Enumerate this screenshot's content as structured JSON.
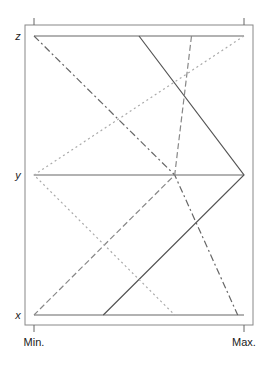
{
  "chart_data": {
    "type": "parallel_coordinates",
    "title": "",
    "variables": [
      "z",
      "y",
      "x"
    ],
    "range_labels": {
      "min": "Min.",
      "max": "Max."
    },
    "xlim": [
      0,
      1
    ],
    "grid": false,
    "legend": null,
    "series": [
      {
        "name": "obs1",
        "line_style": "solid",
        "color": "#555555",
        "values": {
          "z": 0.5,
          "y": 1.0,
          "x": 0.33
        }
      },
      {
        "name": "obs2",
        "line_style": "dashdot",
        "color": "#666666",
        "values": {
          "z": 0.0,
          "y": 0.67,
          "x": 0.97
        }
      },
      {
        "name": "obs3",
        "line_style": "dashed",
        "color": "#888888",
        "values": {
          "z": 0.75,
          "y": 0.67,
          "x": 0.0
        }
      },
      {
        "name": "obs4",
        "line_style": "dotted",
        "color": "#aaaaaa",
        "values": {
          "z": 1.0,
          "y": 0.0,
          "x": 0.67
        }
      }
    ],
    "baseline_lines": [
      {
        "variable": "z",
        "from": 0,
        "to": 1
      },
      {
        "variable": "y",
        "from": 0,
        "to": 1
      },
      {
        "variable": "x",
        "from": 0,
        "to": 1
      }
    ]
  }
}
